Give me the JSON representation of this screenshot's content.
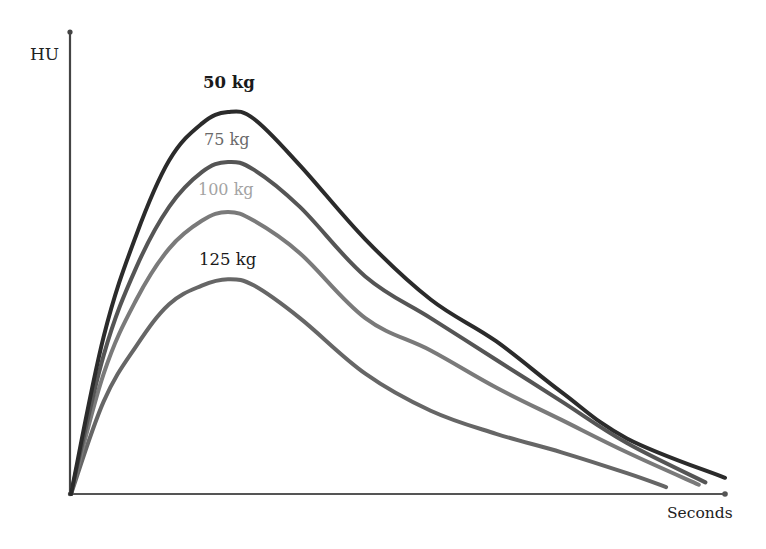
{
  "chart_data": {
    "type": "line",
    "title": "",
    "xlabel": "Seconds",
    "ylabel": "HU",
    "xlim": [
      0,
      100
    ],
    "ylim": [
      0,
      100
    ],
    "grid": false,
    "legend": "inline labels above each curve peak",
    "units_note": "Axes unlabeled (no ticks); values are relative estimates",
    "series": [
      {
        "name": "50 kg",
        "color": "#2b2b2b",
        "label_color": "#1a1a1a",
        "points": [
          [
            0,
            0
          ],
          [
            5,
            34
          ],
          [
            10,
            56
          ],
          [
            15,
            72
          ],
          [
            20,
            80
          ],
          [
            24,
            82.5
          ],
          [
            28,
            81
          ],
          [
            35,
            71
          ],
          [
            45,
            55
          ],
          [
            55,
            42
          ],
          [
            65,
            33
          ],
          [
            75,
            22
          ],
          [
            85,
            12
          ],
          [
            100,
            3.5
          ]
        ]
      },
      {
        "name": "75 kg",
        "color": "#555555",
        "label_color": "#6a6a6a",
        "points": [
          [
            0,
            0
          ],
          [
            5,
            30
          ],
          [
            10,
            49
          ],
          [
            15,
            62
          ],
          [
            20,
            69.5
          ],
          [
            24,
            71.7
          ],
          [
            28,
            70
          ],
          [
            35,
            62
          ],
          [
            45,
            47
          ],
          [
            55,
            38
          ],
          [
            65,
            29
          ],
          [
            75,
            20
          ],
          [
            85,
            11
          ],
          [
            97,
            2.5
          ]
        ]
      },
      {
        "name": "100 kg",
        "color": "#7a7a7a",
        "label_color": "#a0a0a0",
        "points": [
          [
            0,
            0
          ],
          [
            5,
            26
          ],
          [
            10,
            42
          ],
          [
            15,
            53
          ],
          [
            20,
            59
          ],
          [
            24,
            60.9
          ],
          [
            28,
            59
          ],
          [
            35,
            52
          ],
          [
            45,
            38
          ],
          [
            55,
            31
          ],
          [
            65,
            23
          ],
          [
            75,
            16
          ],
          [
            85,
            9
          ],
          [
            96,
            2
          ]
        ]
      },
      {
        "name": "125 kg",
        "color": "#666666",
        "label_color": "#1a1a1a",
        "points": [
          [
            0,
            0
          ],
          [
            5,
            20
          ],
          [
            10,
            32
          ],
          [
            15,
            41
          ],
          [
            20,
            45
          ],
          [
            24,
            46.4
          ],
          [
            28,
            45
          ],
          [
            35,
            38
          ],
          [
            45,
            26
          ],
          [
            55,
            18
          ],
          [
            65,
            13
          ],
          [
            75,
            9
          ],
          [
            85,
            4.5
          ],
          [
            91,
            1.5
          ]
        ]
      }
    ],
    "annotations": [
      {
        "text": "50 kg",
        "x": 24.5,
        "y": 92
      },
      {
        "text": "75 kg",
        "x": 24.5,
        "y": 79.5
      },
      {
        "text": "100 kg",
        "x": 24.5,
        "y": 68.5
      },
      {
        "text": "125 kg",
        "x": 24.5,
        "y": 54
      }
    ]
  },
  "axes": {
    "y_label": "HU",
    "x_label": "Seconds"
  },
  "curve_labels": {
    "kg50": "50 kg",
    "kg75": "75 kg",
    "kg100": "100 kg",
    "kg125": "125 kg"
  }
}
